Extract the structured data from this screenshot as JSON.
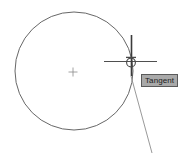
{
  "app": {
    "window_title": "CAD Drawing Area",
    "background_color": "#ffffff"
  },
  "drawing": {
    "geometry_color": "#565656",
    "cursor_color": "#3b3b3b",
    "marker_color": "#4a4a4a",
    "entities": [
      {
        "name": "circle",
        "type": "circle",
        "center_x": 74,
        "center_y": 71,
        "radius": 59
      },
      {
        "name": "circle-center-mark",
        "type": "center-mark",
        "x": 73,
        "y": 72,
        "size": 5
      },
      {
        "name": "tangent-line",
        "type": "line",
        "x1": 131,
        "y1": 76,
        "x2": 152,
        "y2": 153
      }
    ]
  },
  "cursor": {
    "name": "crosshair-cursor",
    "x": 131,
    "y": 61,
    "horizontal_span": [
      104,
      157
    ],
    "vertical_span": [
      35,
      76
    ]
  },
  "osnap": {
    "marker_name": "tangent-snap-marker",
    "marker_x": 131,
    "marker_y": 61,
    "marker_radius": 5,
    "tooltip_label": "Tangent",
    "tooltip_bg": "#a9a9a9",
    "tooltip_border": "#5a5a5a",
    "tooltip_text_color": "#1c1c1c",
    "tooltip_x": 141,
    "tooltip_y": 74
  }
}
